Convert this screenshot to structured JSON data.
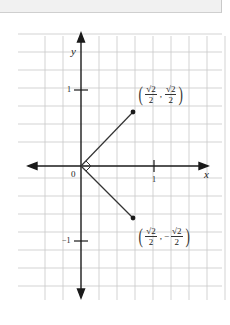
{
  "figure": {
    "axes": {
      "x_label": "x",
      "y_label": "y",
      "origin_label": "0",
      "x_tick_labels": [
        "1"
      ],
      "y_tick_labels": [
        "1",
        "−1"
      ]
    },
    "points": [
      {
        "name": "upper-point",
        "x_num": "√2",
        "x_den": "2",
        "separator": ",",
        "y_sign": "",
        "y_num": "√2",
        "y_den": "2",
        "value": [
          0.7071,
          0.7071
        ]
      },
      {
        "name": "lower-point",
        "x_num": "√2",
        "x_den": "2",
        "separator": ",",
        "y_sign": "−",
        "y_num": "√2",
        "y_den": "2",
        "value": [
          0.7071,
          -0.7071
        ]
      }
    ],
    "right_angle_marker": "right-angle at origin between the two vectors",
    "colors": {
      "grid": "#c8c8c8",
      "axis": "#1a1a1a",
      "vector": "#333333",
      "background": "#ffffff",
      "top_band": "#f1f1f1"
    }
  }
}
